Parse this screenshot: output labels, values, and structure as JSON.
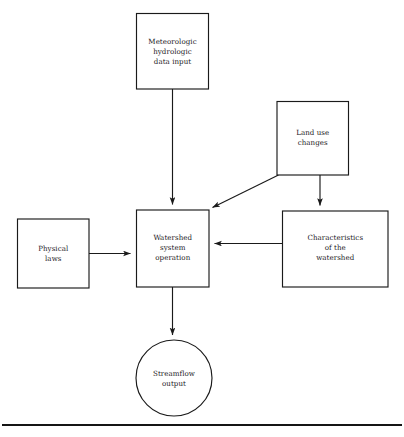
{
  "diagram": {
    "background_color": "#ffffff",
    "line_color": "#1a1a1a",
    "text_color": "#23201e",
    "nodes": [
      {
        "id": "meteorologic-input",
        "shape": "rectangle",
        "lines": [
          "Meteorologic",
          "hydrologic",
          "data input"
        ]
      },
      {
        "id": "land-use-changes",
        "shape": "rectangle",
        "lines": [
          "Land use",
          "changes"
        ]
      },
      {
        "id": "physical-laws",
        "shape": "rectangle",
        "lines": [
          "Physical",
          "laws"
        ]
      },
      {
        "id": "watershed-system-operation",
        "shape": "rectangle",
        "lines": [
          "Watershed",
          "system",
          "operation"
        ]
      },
      {
        "id": "characteristics-of-watershed",
        "shape": "rectangle",
        "lines": [
          "Characteristics",
          "of the",
          "watershed"
        ]
      },
      {
        "id": "streamflow-output",
        "shape": "circle",
        "lines": [
          "Streamflow",
          "output"
        ]
      }
    ],
    "edges": [
      {
        "id": "meteorologic-to-watershed",
        "from": "meteorologic-input",
        "to": "watershed-system-operation",
        "style": "straight-arrow"
      },
      {
        "id": "landuse-to-watershed",
        "from": "land-use-changes",
        "to": "watershed-system-operation",
        "style": "diagonal-arrow"
      },
      {
        "id": "landuse-to-characteristics",
        "from": "land-use-changes",
        "to": "characteristics-of-watershed",
        "style": "straight-arrow"
      },
      {
        "id": "physicallaws-to-watershed",
        "from": "physical-laws",
        "to": "watershed-system-operation",
        "style": "straight-arrow"
      },
      {
        "id": "characteristics-to-watershed",
        "from": "characteristics-of-watershed",
        "to": "watershed-system-operation",
        "style": "straight-arrow"
      },
      {
        "id": "watershed-to-streamflow",
        "from": "watershed-system-operation",
        "to": "streamflow-output",
        "style": "straight-arrow"
      }
    ]
  }
}
